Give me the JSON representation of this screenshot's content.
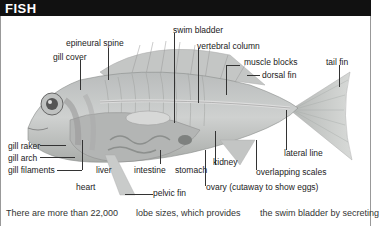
{
  "header": {
    "title": "FISH"
  },
  "labels": {
    "epineural_spine": "epineural spine",
    "gill_cover": "gill cover",
    "swim_bladder": "swim bladder",
    "vertebral_column": "vertebral column",
    "muscle_blocks": "muscle blocks",
    "dorsal_fin": "dorsal fin",
    "tail_fin": "tail fin",
    "gill_raker": "gill raker",
    "gill_arch": "gill arch",
    "gill_filaments": "gill filaments",
    "liver": "liver",
    "intestine": "intestine",
    "stomach": "stomach",
    "kidney": "kidney",
    "lateral_line": "lateral line",
    "overlapping_scales": "overlapping scales",
    "heart": "heart",
    "pelvic_fin": "pelvic fin",
    "ovary": "ovary (cutaway to show eggs)"
  },
  "body_text": {
    "col1": "There are more than 22,000",
    "col2": "lobe sizes, which provides",
    "col3": "the swim bladder by secreting"
  },
  "colors": {
    "header_bg": "#111111",
    "header_text": "#ffffff"
  }
}
